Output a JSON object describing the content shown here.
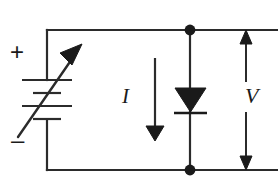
{
  "diagram": {
    "type": "electrical-circuit-schematic",
    "background_color": "#ffffff",
    "line_color": "#2b2b2b",
    "labels": {
      "current": "I",
      "voltage": "V",
      "source_positive": "+",
      "source_negative": "–"
    },
    "components": [
      {
        "name": "variable-dc-source",
        "symbol": "battery-with-diagonal-arrow",
        "position": "left-branch",
        "polarity_top": "+",
        "polarity_bottom": "–",
        "plates": 4
      },
      {
        "name": "diode",
        "symbol": "triangle-with-cathode-bar",
        "orientation": "pointing-down",
        "position": "right-branch"
      },
      {
        "name": "current-arrow",
        "symbol": "arrow-down",
        "label": "I"
      },
      {
        "name": "voltage-arrow",
        "symbol": "double-headed-arrow-vertical",
        "label": "V"
      },
      {
        "name": "junction-node-top",
        "symbol": "filled-dot"
      },
      {
        "name": "junction-node-bottom",
        "symbol": "filled-dot"
      }
    ]
  }
}
